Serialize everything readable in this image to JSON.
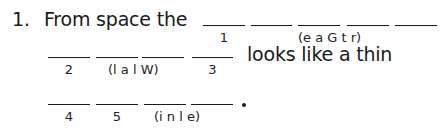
{
  "question": {
    "number": "1.",
    "intro": "From space the",
    "middle": "looks like a thin",
    "end_punctuation": "."
  },
  "rows": [
    {
      "blanks": [
        {
          "x": 203,
          "w": 42,
          "label": "1"
        },
        {
          "x": 251,
          "w": 41,
          "label": ""
        },
        {
          "x": 298,
          "w": 42,
          "label": ""
        },
        {
          "x": 347,
          "w": 42,
          "label": ""
        },
        {
          "x": 395,
          "w": 42,
          "label": ""
        }
      ],
      "hint": "(e a G t r)"
    },
    {
      "blanks": [
        {
          "x": 48,
          "w": 42,
          "label": "2"
        },
        {
          "x": 96,
          "w": 42,
          "label": ""
        },
        {
          "x": 142,
          "w": 42,
          "label": ""
        },
        {
          "x": 192,
          "w": 41,
          "label": "3"
        }
      ],
      "hint": "(l a l W)"
    },
    {
      "blanks": [
        {
          "x": 48,
          "w": 42,
          "label": "4"
        },
        {
          "x": 96,
          "w": 42,
          "label": "5"
        },
        {
          "x": 144,
          "w": 42,
          "label": ""
        },
        {
          "x": 191,
          "w": 42,
          "label": ""
        }
      ],
      "hint": "(i n l e)"
    }
  ]
}
